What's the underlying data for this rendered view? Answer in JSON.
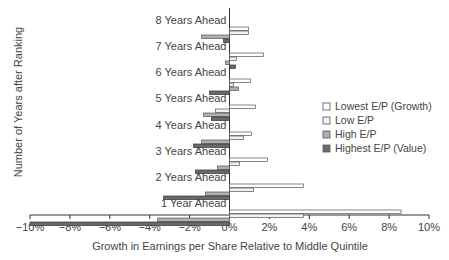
{
  "chart_data": {
    "type": "bar",
    "orientation": "horizontal",
    "title": "",
    "xlabel": "Growth in Earnings per Share Relative to Middle Quintile",
    "ylabel": "Number of Years after Ranking",
    "xlim": [
      -10,
      10
    ],
    "x_ticks": [
      "−10%",
      "−8%",
      "−6%",
      "−4%",
      "−2%",
      "0%",
      "2%",
      "4%",
      "6%",
      "8%",
      "10%"
    ],
    "x_tick_values": [
      -10,
      -8,
      -6,
      -4,
      -2,
      0,
      2,
      4,
      6,
      8,
      10
    ],
    "grid": false,
    "legend_position": "right",
    "categories": [
      "1 Year Ahead",
      "2 Years Ahead",
      "3 Years Ahead",
      "4 Years Ahead",
      "5 Years Ahead",
      "6 Years Ahead",
      "7 Years Ahead",
      "8 Years Ahead"
    ],
    "series": [
      {
        "name": "Lowest E/P (Growth)",
        "color": "#ffffff",
        "values": [
          8.6,
          3.7,
          1.9,
          1.1,
          1.3,
          1.05,
          1.7,
          0.95
        ]
      },
      {
        "name": "Low E/P",
        "color": "#f2f2f2",
        "values": [
          3.7,
          1.2,
          0.5,
          0.7,
          -0.7,
          0.2,
          0.35,
          0.95
        ]
      },
      {
        "name": "High E/P",
        "color": "#b0b0b0",
        "values": [
          -3.6,
          -1.2,
          -0.6,
          -1.4,
          -1.3,
          0.45,
          -0.2,
          -1.4
        ]
      },
      {
        "name": "Highest E/P (Value)",
        "color": "#6a6a6a",
        "values": [
          -10.0,
          -3.3,
          -1.7,
          -1.8,
          -0.9,
          -1.0,
          0.3,
          -0.3
        ]
      }
    ]
  }
}
